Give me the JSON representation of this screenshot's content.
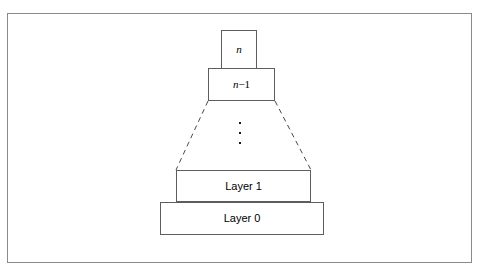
{
  "figure": {
    "kind": "layered-architecture-pyramid-diagram",
    "background_color": "#ffffff",
    "frame_color": "#8a8a8a",
    "box_border_color": "#5d5d5d",
    "text_color": "#000000",
    "layers": [
      {
        "id": "layer-n",
        "label_plain": "n",
        "label_variable": "n",
        "style": "italic",
        "position": "top"
      },
      {
        "id": "layer-n-minus-1",
        "label_plain": "n − 1",
        "label_variable": "n",
        "label_operator": "−",
        "label_number": "1",
        "position": "second-from-top"
      },
      {
        "id": "layer-ellipsis",
        "label_plain": "⋮",
        "meaning": "vertical-ellipsis-intermediate-layers",
        "dot_count": 3
      },
      {
        "id": "layer-1",
        "label_plain": "Layer 1",
        "position": "second-from-bottom"
      },
      {
        "id": "layer-0",
        "label_plain": "Layer 0",
        "position": "bottom"
      }
    ],
    "connectors": {
      "style": "dashed",
      "description": "dashed slanted lines connecting layer n-1 to Layer 1",
      "left_line": {
        "x1": 208,
        "y1": 101,
        "x2": 176,
        "y2": 170
      },
      "right_line": {
        "x1": 275,
        "y1": 101,
        "x2": 311,
        "y2": 170
      }
    }
  }
}
